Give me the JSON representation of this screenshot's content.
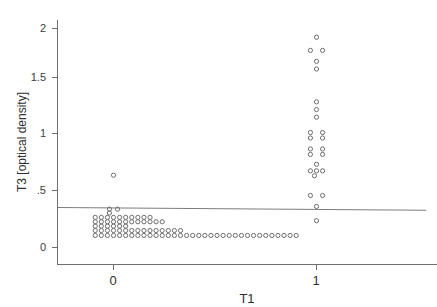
{
  "chart_data": {
    "type": "scatter",
    "title": "",
    "subtitle": "",
    "xlabel": "T1",
    "ylabel": "T3 [optical density]",
    "x_ticks": [
      "0",
      "1"
    ],
    "x_tick_values": [
      0,
      1
    ],
    "y_ticks": [
      "0",
      ".5",
      "1",
      "1.5",
      "2"
    ],
    "y_tick_values": [
      0,
      0.5,
      1,
      1.5,
      2
    ],
    "xlim": [
      -0.28,
      1.55
    ],
    "ylim": [
      -0.04,
      2.18
    ],
    "grid": false,
    "legend": null,
    "marker_style": "open-circle",
    "annotations": [],
    "fit_line": {
      "label": "linear fit",
      "x_start": -0.275,
      "x_end": 1.54,
      "y_start": 0.365,
      "y_end": 0.34,
      "slope": -0.0138,
      "intercept": 0.3612
    },
    "series": [
      {
        "name": "T3 vs T1",
        "points": [
          [
            0.0,
            0.66
          ],
          [
            -0.02,
            0.35
          ],
          [
            0.02,
            0.35
          ],
          [
            -0.02,
            0.315
          ],
          [
            -0.09,
            0.275
          ],
          [
            -0.06,
            0.275
          ],
          [
            -0.03,
            0.275
          ],
          [
            0.0,
            0.275
          ],
          [
            0.03,
            0.275
          ],
          [
            0.06,
            0.275
          ],
          [
            0.09,
            0.275
          ],
          [
            0.12,
            0.275
          ],
          [
            0.15,
            0.275
          ],
          [
            0.18,
            0.275
          ],
          [
            -0.09,
            0.235
          ],
          [
            -0.06,
            0.235
          ],
          [
            -0.03,
            0.235
          ],
          [
            0.0,
            0.235
          ],
          [
            0.03,
            0.235
          ],
          [
            0.06,
            0.235
          ],
          [
            0.09,
            0.235
          ],
          [
            0.12,
            0.235
          ],
          [
            0.15,
            0.235
          ],
          [
            0.18,
            0.235
          ],
          [
            0.21,
            0.235
          ],
          [
            0.24,
            0.235
          ],
          [
            -0.09,
            0.195
          ],
          [
            -0.06,
            0.195
          ],
          [
            -0.03,
            0.195
          ],
          [
            0.0,
            0.195
          ],
          [
            0.03,
            0.195
          ],
          [
            0.06,
            0.195
          ],
          [
            -0.09,
            0.155
          ],
          [
            -0.06,
            0.155
          ],
          [
            -0.03,
            0.155
          ],
          [
            0.0,
            0.155
          ],
          [
            0.03,
            0.155
          ],
          [
            0.06,
            0.155
          ],
          [
            0.09,
            0.155
          ],
          [
            0.12,
            0.155
          ],
          [
            0.15,
            0.155
          ],
          [
            0.18,
            0.155
          ],
          [
            0.21,
            0.155
          ],
          [
            0.24,
            0.155
          ],
          [
            0.27,
            0.155
          ],
          [
            0.3,
            0.155
          ],
          [
            0.33,
            0.155
          ],
          [
            -0.09,
            0.11
          ],
          [
            -0.06,
            0.11
          ],
          [
            -0.03,
            0.11
          ],
          [
            0.0,
            0.11
          ],
          [
            0.03,
            0.11
          ],
          [
            0.06,
            0.11
          ],
          [
            0.09,
            0.11
          ],
          [
            0.12,
            0.11
          ],
          [
            0.15,
            0.11
          ],
          [
            0.18,
            0.11
          ],
          [
            0.21,
            0.11
          ],
          [
            0.24,
            0.11
          ],
          [
            0.27,
            0.11
          ],
          [
            0.3,
            0.11
          ],
          [
            0.33,
            0.11
          ],
          [
            0.36,
            0.11
          ],
          [
            0.39,
            0.11
          ],
          [
            0.42,
            0.11
          ],
          [
            0.45,
            0.11
          ],
          [
            0.48,
            0.11
          ],
          [
            0.51,
            0.11
          ],
          [
            0.54,
            0.11
          ],
          [
            0.57,
            0.11
          ],
          [
            0.6,
            0.11
          ],
          [
            0.63,
            0.11
          ],
          [
            0.66,
            0.11
          ],
          [
            0.69,
            0.11
          ],
          [
            0.72,
            0.11
          ],
          [
            0.75,
            0.11
          ],
          [
            0.78,
            0.11
          ],
          [
            0.81,
            0.11
          ],
          [
            0.84,
            0.11
          ],
          [
            0.87,
            0.11
          ],
          [
            0.9,
            0.11
          ],
          [
            1.0,
            1.92
          ],
          [
            0.97,
            1.8
          ],
          [
            1.03,
            1.8
          ],
          [
            1.0,
            1.7
          ],
          [
            1.0,
            1.63
          ],
          [
            1.0,
            1.33
          ],
          [
            1.0,
            1.26
          ],
          [
            1.0,
            1.19
          ],
          [
            0.97,
            1.05
          ],
          [
            1.03,
            1.05
          ],
          [
            0.97,
            1.0
          ],
          [
            1.03,
            1.0
          ],
          [
            0.97,
            0.9
          ],
          [
            1.03,
            0.9
          ],
          [
            0.97,
            0.85
          ],
          [
            1.03,
            0.85
          ],
          [
            1.0,
            0.76
          ],
          [
            0.97,
            0.7
          ],
          [
            1.0,
            0.7
          ],
          [
            1.03,
            0.7
          ],
          [
            0.99,
            0.655
          ],
          [
            0.97,
            0.475
          ],
          [
            1.03,
            0.475
          ],
          [
            1.0,
            0.375
          ],
          [
            1.0,
            0.245
          ]
        ]
      }
    ]
  }
}
